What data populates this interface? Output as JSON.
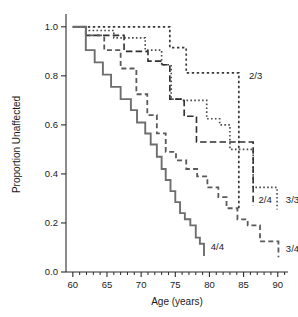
{
  "chart_data": {
    "type": "line",
    "title": "",
    "subtitle": "",
    "xlabel": "Age (years)",
    "ylabel": "Proportion Unaffected",
    "xlim": [
      59.0,
      91.5
    ],
    "ylim": [
      0.0,
      1.04
    ],
    "grid": false,
    "legend_position": "inline-right-of-curve-ends",
    "x_ticks_major": [
      60,
      65,
      70,
      75,
      80,
      85,
      90
    ],
    "x_ticklabels": [
      "60",
      "65",
      "70",
      "75",
      "80",
      "85",
      "90"
    ],
    "x_ticks_minor": [
      61,
      62,
      63,
      64,
      66,
      67,
      68,
      69,
      71,
      72,
      73,
      74,
      76,
      77,
      78,
      79,
      81,
      82,
      83,
      84,
      86,
      87,
      88,
      89,
      91
    ],
    "y_ticks_major": [
      0.0,
      0.2,
      0.4,
      0.6,
      0.8,
      1.0
    ],
    "y_ticklabels": [
      "0.0",
      "0.2",
      "0.4",
      "0.6",
      "0.8",
      "1.0"
    ],
    "curve_style_note": "Kaplan-Meier step survival curves, one per APOE genotype",
    "series": [
      {
        "name": "2/3",
        "label": "2/3",
        "linestyle": "dotted-coarse",
        "color": "#3a3a3a",
        "label_x": 85.2,
        "label_y": 0.8,
        "x": [
          60.0,
          74.2,
          74.2,
          76.6,
          76.6,
          84.3,
          84.3,
          84.3
        ],
        "y": [
          1.0,
          1.0,
          0.915,
          0.915,
          0.812,
          0.812,
          0.812,
          0.255
        ]
      },
      {
        "name": "3/3",
        "label": "3/3",
        "linestyle": "dotted-fine",
        "color": "#4a4a4a",
        "label_x": 90.6,
        "label_y": 0.295,
        "x": [
          60.0,
          62.4,
          62.4,
          66.0,
          66.0,
          70.6,
          70.6,
          73.0,
          73.0,
          74.4,
          74.4,
          76.2,
          76.2,
          79.6,
          79.6,
          81.5,
          81.5,
          83.0,
          83.0,
          86.4,
          86.4,
          89.9,
          89.9
        ],
        "y": [
          1.0,
          1.0,
          0.985,
          0.985,
          0.955,
          0.955,
          0.905,
          0.905,
          0.845,
          0.845,
          0.705,
          0.705,
          0.7,
          0.7,
          0.625,
          0.625,
          0.6,
          0.6,
          0.5,
          0.5,
          0.345,
          0.345,
          0.255
        ]
      },
      {
        "name": "2/4",
        "label": "2/4",
        "linestyle": "dashed-coarse",
        "color": "#2f2f2f",
        "label_x": 86.6,
        "label_y": 0.295,
        "x": [
          60.0,
          61.9,
          61.9,
          67.5,
          67.5,
          71.0,
          71.0,
          73.1,
          73.1,
          74.2,
          74.2,
          76.3,
          76.3,
          78.1,
          78.1,
          86.4,
          86.4
        ],
        "y": [
          1.0,
          1.0,
          0.965,
          0.965,
          0.9,
          0.9,
          0.86,
          0.86,
          0.845,
          0.845,
          0.705,
          0.705,
          0.635,
          0.635,
          0.53,
          0.53,
          0.27
        ]
      },
      {
        "name": "3/4",
        "label": "3/4",
        "linestyle": "dashed-medium",
        "color": "#5a5a5a",
        "label_x": 90.6,
        "label_y": 0.095,
        "x": [
          60.0,
          61.9,
          61.9,
          64.6,
          64.6,
          67.0,
          67.0,
          69.3,
          69.3,
          70.9,
          70.9,
          72.3,
          72.3,
          73.6,
          73.6,
          75.1,
          75.1,
          76.6,
          76.6,
          78.2,
          78.2,
          79.7,
          79.7,
          81.3,
          81.3,
          82.5,
          82.5,
          84.1,
          84.1,
          85.6,
          85.6,
          87.4,
          87.4,
          90.1,
          90.1
        ],
        "y": [
          1.0,
          1.0,
          0.965,
          0.965,
          0.905,
          0.905,
          0.83,
          0.83,
          0.725,
          0.725,
          0.64,
          0.64,
          0.565,
          0.565,
          0.49,
          0.49,
          0.455,
          0.455,
          0.42,
          0.42,
          0.39,
          0.39,
          0.345,
          0.345,
          0.305,
          0.305,
          0.26,
          0.26,
          0.215,
          0.215,
          0.19,
          0.19,
          0.125,
          0.125,
          0.06
        ]
      },
      {
        "name": "4/4",
        "label": "4/4",
        "linestyle": "solid",
        "color": "#6e6e6e",
        "label_x": 79.6,
        "label_y": 0.105,
        "x": [
          60.0,
          61.9,
          61.9,
          63.2,
          63.2,
          64.4,
          64.4,
          65.6,
          65.6,
          67.0,
          67.0,
          68.5,
          68.5,
          69.4,
          69.4,
          70.6,
          70.6,
          71.4,
          71.4,
          72.3,
          72.3,
          73.0,
          73.0,
          73.6,
          73.6,
          74.3,
          74.3,
          75.0,
          75.0,
          75.7,
          75.7,
          76.4,
          76.4,
          77.2,
          77.2,
          78.0,
          78.0,
          78.6,
          78.6,
          79.2,
          79.2
        ],
        "y": [
          1.0,
          1.0,
          0.905,
          0.905,
          0.855,
          0.855,
          0.805,
          0.805,
          0.755,
          0.755,
          0.705,
          0.705,
          0.66,
          0.66,
          0.61,
          0.61,
          0.565,
          0.565,
          0.52,
          0.52,
          0.47,
          0.47,
          0.42,
          0.42,
          0.375,
          0.375,
          0.33,
          0.33,
          0.285,
          0.285,
          0.24,
          0.24,
          0.215,
          0.215,
          0.19,
          0.19,
          0.14,
          0.14,
          0.115,
          0.115,
          0.065
        ]
      }
    ]
  }
}
